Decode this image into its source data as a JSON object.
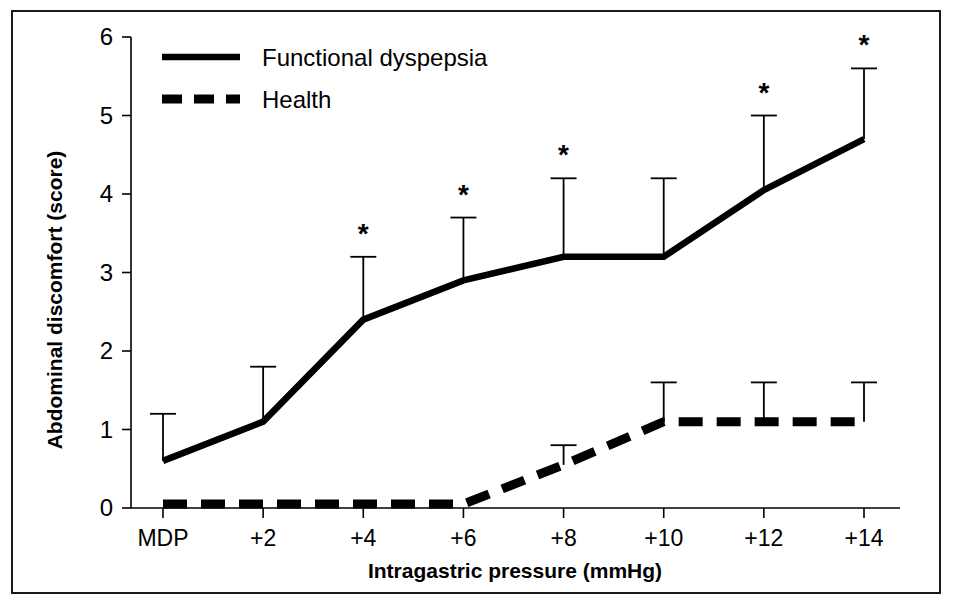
{
  "figure": {
    "border_color": "#1a1a1a",
    "background": "#ffffff",
    "ink_color": "#000000"
  },
  "axis": {
    "y_title": "Abdominal discomfort (score)",
    "x_title": "Intragastric pressure (mmHg)",
    "y_ticks": [
      "0",
      "1",
      "2",
      "3",
      "4",
      "5",
      "6"
    ],
    "x_ticks": [
      "MDP",
      "+2",
      "+4",
      "+6",
      "+8",
      "+10",
      "+12",
      "+14"
    ]
  },
  "legend": {
    "items": [
      {
        "label": "Functional dyspepsia",
        "style": "solid",
        "color": "#000000"
      },
      {
        "label": "Health",
        "style": "dashed",
        "color": "#000000"
      }
    ]
  },
  "annotations": {
    "significance_marker": "*"
  },
  "chart_data": {
    "type": "line",
    "title": "",
    "xlabel": "Intragastric pressure (mmHg)",
    "ylabel": "Abdominal discomfort (score)",
    "categories": [
      "MDP",
      "+2",
      "+4",
      "+6",
      "+8",
      "+10",
      "+12",
      "+14"
    ],
    "ylim": [
      0,
      6
    ],
    "yticks": [
      0,
      1,
      2,
      3,
      4,
      5,
      6
    ],
    "grid": false,
    "legend_position": "top-left",
    "error_bars": "upper-only",
    "series": [
      {
        "name": "Functional dyspepsia",
        "style": "solid",
        "color": "#000000",
        "values": [
          0.6,
          1.1,
          2.4,
          2.9,
          3.2,
          3.2,
          4.05,
          4.7
        ],
        "error_upper": [
          1.2,
          1.8,
          3.2,
          3.7,
          4.2,
          4.2,
          5.0,
          5.6
        ],
        "significance": [
          false,
          false,
          true,
          true,
          true,
          false,
          true,
          true
        ]
      },
      {
        "name": "Health",
        "style": "dashed",
        "color": "#000000",
        "values": [
          0.05,
          0.05,
          0.05,
          0.05,
          0.55,
          1.1,
          1.1,
          1.1
        ],
        "error_upper": [
          null,
          null,
          null,
          null,
          0.8,
          1.6,
          1.6,
          1.6
        ],
        "significance": [
          false,
          false,
          false,
          false,
          false,
          false,
          false,
          false
        ]
      }
    ]
  }
}
